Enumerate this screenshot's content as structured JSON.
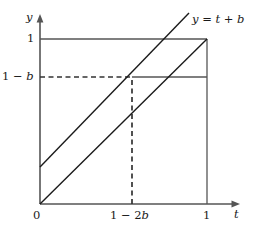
{
  "figure": {
    "title": "",
    "axes": {
      "x_axis_name": "t",
      "y_axis_name": "y"
    },
    "tick_labels": {
      "origin": "0",
      "x_mid": "1 − 2b",
      "x_max": "1",
      "y_mid": "1 − b",
      "y_max": "1"
    },
    "annotations": {
      "line_label": "y = t + b"
    },
    "colors": {
      "axis": "#555555",
      "line": "#1a1a1a",
      "guide": "#333333",
      "background": "#ffffff"
    }
  },
  "chart_data": {
    "type": "line",
    "title": "",
    "xlabel": "t",
    "ylabel": "y",
    "xlim": [
      0,
      1.18
    ],
    "ylim": [
      0,
      1.12
    ],
    "grid": false,
    "legend_position": "inline-right-of-line",
    "xticks": [
      0,
      0.55,
      1
    ],
    "xticklabels": [
      "0",
      "1 − 2b",
      "1"
    ],
    "yticks": [
      0.78,
      1
    ],
    "yticklabels": [
      "1 − b",
      "1"
    ],
    "series": [
      {
        "name": "y = t",
        "style": "solid",
        "points": [
          [
            0,
            0
          ],
          [
            1,
            1
          ]
        ]
      },
      {
        "name": "y = t + b",
        "style": "solid",
        "label": "y = t + b",
        "points": [
          [
            0,
            0.22
          ],
          [
            0.88,
            1.12
          ]
        ]
      }
    ],
    "guides": [
      {
        "name": "y-equals-1-line",
        "style": "solid",
        "points": [
          [
            0,
            1
          ],
          [
            1,
            1
          ]
        ]
      },
      {
        "name": "y-equals-1-minus-b-dashed",
        "style": "dashed",
        "points": [
          [
            0,
            0.78
          ],
          [
            0.55,
            0.78
          ]
        ]
      },
      {
        "name": "y-equals-1-minus-b-solid",
        "style": "solid",
        "points": [
          [
            0.55,
            0.78
          ],
          [
            1,
            0.78
          ]
        ]
      },
      {
        "name": "x-equals-1-minus-2b-dashed",
        "style": "dashed",
        "points": [
          [
            0.55,
            0
          ],
          [
            0.55,
            0.78
          ]
        ]
      },
      {
        "name": "x-equals-1-line",
        "style": "solid",
        "points": [
          [
            1,
            0
          ],
          [
            1,
            1
          ]
        ]
      }
    ]
  }
}
